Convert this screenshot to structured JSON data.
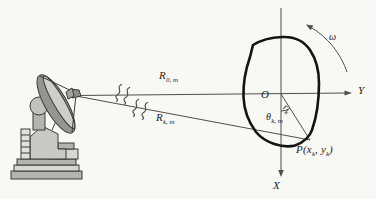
{
  "labels": {
    "r0m": {
      "base": "R",
      "sub": "0, m"
    },
    "rkm": {
      "base": "R",
      "sub": "k, m"
    },
    "omega": "ω",
    "origin": "O",
    "axis_y": "Y",
    "axis_x": "X",
    "rk": {
      "base": "r",
      "sub": "k"
    },
    "theta": {
      "base": "θ",
      "sub": "k, m"
    },
    "p": {
      "pre": "P(x",
      "sub1": "k",
      "mid": ", y",
      "sub2": "k",
      "post": ")"
    }
  },
  "colors": {
    "background": "#f8f8f4",
    "line": "#4f4f4c",
    "contour": "#141414",
    "text": "#26241f",
    "radar_outline": "#3a3a36"
  },
  "icons": [
    {
      "name": "radar-antenna-icon"
    },
    {
      "name": "wave-squiggles-icon"
    },
    {
      "name": "rotation-arrow-icon"
    }
  ]
}
